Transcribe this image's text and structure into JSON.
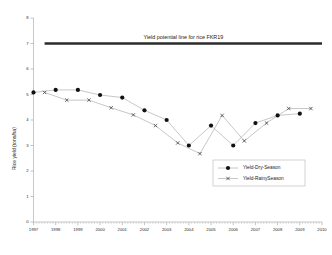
{
  "chart_data": {
    "type": "line",
    "title": "",
    "xlabel": "",
    "ylabel": "Rice yield (tons/ha)",
    "xlim": [
      1997,
      2010
    ],
    "ylim": [
      0,
      8
    ],
    "yticks": [
      0,
      1,
      2,
      3,
      4,
      5,
      6,
      7,
      8
    ],
    "xticks": [
      1997,
      1998,
      1999,
      2000,
      2001,
      2002,
      2003,
      2004,
      2005,
      2006,
      2007,
      2008,
      2009,
      2010
    ],
    "grid": false,
    "legend_position": "lower-right inside axes",
    "annotations": [
      {
        "name": "yield-potential-line",
        "text": "Yield potential line for rice FKR19",
        "y": 7.0,
        "x_start": 1997.5,
        "x_end": 2010.0,
        "style": "thick horizontal reference line with centered label above"
      }
    ],
    "series": [
      {
        "name": "Yield-Dry-Season",
        "marker": "filled-circle",
        "color": "#111111",
        "x": [
          1997,
          1998,
          1999,
          2000,
          2001,
          2002,
          2003,
          2004,
          2005,
          2006,
          2007,
          2008,
          2009
        ],
        "values": [
          5.08,
          5.18,
          5.18,
          4.98,
          4.88,
          4.38,
          4.0,
          3.0,
          3.78,
          3.0,
          3.88,
          4.18,
          4.25
        ]
      },
      {
        "name": "Yield-RainySeason",
        "marker": "cross",
        "color": "#3b3b3b",
        "x": [
          1997.5,
          1998.5,
          1999.5,
          2000.5,
          2001.5,
          2002.5,
          2003.5,
          2004.5,
          2005.5,
          2006.5,
          2007.5,
          2008.5,
          2009.5
        ],
        "values": [
          5.08,
          4.78,
          4.78,
          4.48,
          4.2,
          3.78,
          3.1,
          2.68,
          4.18,
          3.18,
          3.88,
          4.45,
          4.45
        ]
      }
    ]
  },
  "axes": {
    "y_axis_title": "Rice yield (tons/ha)",
    "y_tick_labels": [
      "8",
      "7",
      "6",
      "5",
      "4",
      "3",
      "2",
      "1",
      "0"
    ],
    "x_tick_labels": [
      "1997",
      "1998",
      "1999",
      "2000",
      "2001",
      "2002",
      "2003",
      "2004",
      "2005",
      "2006",
      "2007",
      "2008",
      "2009",
      "2010"
    ]
  },
  "reference": {
    "label": "Yield potential line for rice FKR19",
    "value": "7"
  },
  "legend": {
    "entries": [
      {
        "label": "Yield-Dry-Season",
        "marker": "filled-circle"
      },
      {
        "label": "Yield-RainySeason",
        "marker": "cross"
      }
    ]
  },
  "colors": {
    "series_line": "#a8a8a8",
    "dry_marker": "#111111",
    "rainy_marker": "#3b3b3b",
    "reference_line": "#2b2b2b",
    "axis": "#b0b0b0",
    "background": "#ffffff"
  }
}
